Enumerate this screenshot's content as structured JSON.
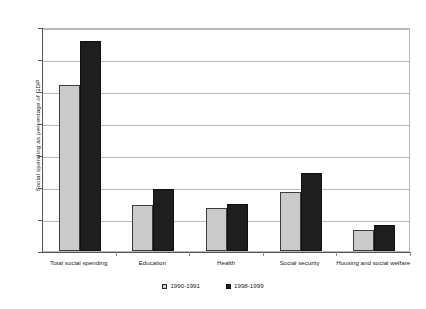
{
  "chart_data": {
    "type": "bar",
    "title": "",
    "xlabel": "",
    "ylabel": "Social spending as percentage of GDP",
    "ylim": [
      0,
      14
    ],
    "ytick_step": 2,
    "yticks": [
      "14",
      "12",
      "10",
      "8",
      "6",
      "4",
      "2",
      "0"
    ],
    "grid": true,
    "legend_position": "bottom",
    "categories": [
      "Total social spending",
      "Education",
      "Health",
      "Social security",
      "Housing and social welfare"
    ],
    "series": [
      {
        "name": "1990-1991",
        "color": "#cbcbcb",
        "values": [
          10.4,
          2.9,
          2.7,
          3.7,
          1.3
        ]
      },
      {
        "name": "1998-1999",
        "color": "#1e1e1e",
        "values": [
          13.1,
          3.9,
          2.95,
          4.85,
          1.6
        ]
      }
    ]
  }
}
